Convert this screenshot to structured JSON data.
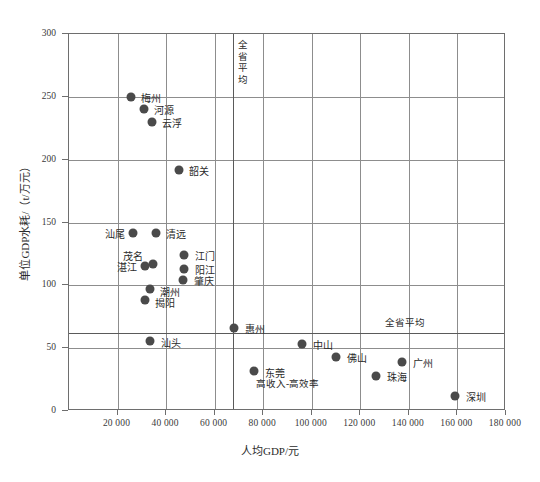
{
  "chart_data": {
    "type": "scatter",
    "title": "",
    "xlabel": "人均GDP/元",
    "ylabel": "单位GDP水耗/（t/万元）",
    "xlim": [
      0,
      180000
    ],
    "ylim": [
      0,
      300
    ],
    "grid": true,
    "legend": "none",
    "xticks": [
      20000,
      40000,
      60000,
      80000,
      100000,
      120000,
      140000,
      160000,
      180000
    ],
    "xticklabels": [
      "20 000",
      "40 000",
      "60 000",
      "80 000",
      "100 000",
      "120 000",
      "140 000",
      "160 000",
      "180 000"
    ],
    "yticks": [
      0,
      50,
      100,
      150,
      200,
      250,
      300
    ],
    "yticklabels": [
      "0",
      "50",
      "100",
      "150",
      "200",
      "250",
      "300"
    ],
    "points": [
      {
        "label": "梅州",
        "x": 25500,
        "y": 250,
        "lx": 10,
        "ly": 0
      },
      {
        "label": "河源",
        "x": 31000,
        "y": 240,
        "lx": 10,
        "ly": 0
      },
      {
        "label": "云浮",
        "x": 34000,
        "y": 230,
        "lx": 10,
        "ly": 0
      },
      {
        "label": "韶关",
        "x": 45500,
        "y": 192,
        "lx": 10,
        "ly": 0
      },
      {
        "label": "汕尾",
        "x": 26500,
        "y": 142,
        "lx": -28,
        "ly": 0
      },
      {
        "label": "清远",
        "x": 36000,
        "y": 142,
        "lx": 10,
        "ly": 0
      },
      {
        "label": "茂名",
        "x": 34500,
        "y": 117,
        "lx": -30,
        "ly": -9
      },
      {
        "label": "江门",
        "x": 47500,
        "y": 124,
        "lx": 11,
        "ly": 0
      },
      {
        "label": "湛江",
        "x": 31500,
        "y": 115,
        "lx": -28,
        "ly": 0
      },
      {
        "label": "阳江",
        "x": 47500,
        "y": 113,
        "lx": 11,
        "ly": 0
      },
      {
        "label": "肇庆",
        "x": 47000,
        "y": 104,
        "lx": 11,
        "ly": 0
      },
      {
        "label": "潮州",
        "x": 33500,
        "y": 97,
        "lx": 10,
        "ly": 2
      },
      {
        "label": "揭阳",
        "x": 31500,
        "y": 88,
        "lx": 10,
        "ly": 2
      },
      {
        "label": "惠州",
        "x": 68000,
        "y": 66,
        "lx": 11,
        "ly": 0
      },
      {
        "label": "汕头",
        "x": 33500,
        "y": 56,
        "lx": 11,
        "ly": 1
      },
      {
        "label": "中山",
        "x": 96000,
        "y": 53,
        "lx": 11,
        "ly": 0
      },
      {
        "label": "佛山",
        "x": 110000,
        "y": 43,
        "lx": 11,
        "ly": 0
      },
      {
        "label": "广州",
        "x": 137000,
        "y": 39,
        "lx": 11,
        "ly": 0
      },
      {
        "label": "东莞",
        "x": 76000,
        "y": 32,
        "lx": 11,
        "ly": 1
      },
      {
        "label": "珠海",
        "x": 126500,
        "y": 28,
        "lx": 11,
        "ly": 0
      },
      {
        "label": "深圳",
        "x": 159000,
        "y": 12,
        "lx": 11,
        "ly": 0
      }
    ],
    "reference_lines": [
      {
        "name": "provincial-average-x",
        "orientation": "vertical",
        "x": 67500,
        "label": "全省平均"
      },
      {
        "name": "provincial-average-y",
        "orientation": "horizontal",
        "y": 62,
        "label": "全省平均"
      }
    ],
    "annotations": [
      {
        "name": "quadrant-label-high-income-high-efficiency",
        "text": "高收入-高效率",
        "x": 90000,
        "y": 22
      }
    ]
  }
}
